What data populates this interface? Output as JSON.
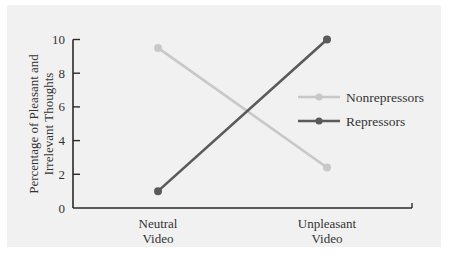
{
  "chart_data": {
    "type": "line",
    "title": "",
    "xlabel": "",
    "ylabel": "Percentage of Pleasant and Irrelevant Thoughts",
    "ylabel_lines": [
      "Percentage of Pleasant and",
      "Irrelevant Thoughts"
    ],
    "categories": [
      "Neutral Video",
      "Unpleasant Video"
    ],
    "category_lines": [
      [
        "Neutral",
        "Video"
      ],
      [
        "Unpleasant",
        "Video"
      ]
    ],
    "series": [
      {
        "name": "Nonrepressors",
        "values": [
          9.5,
          2.4
        ],
        "color": "#c8c8c8"
      },
      {
        "name": "Repressors",
        "values": [
          1.0,
          10.0
        ],
        "color": "#5a5a5a"
      }
    ],
    "ylim": [
      0,
      10
    ],
    "yticks": [
      0,
      2,
      4,
      6,
      8,
      10
    ],
    "grid": false,
    "legend_position": "right"
  }
}
